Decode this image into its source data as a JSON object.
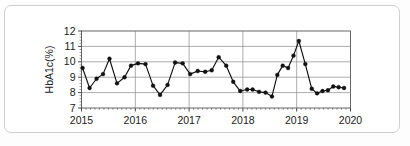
{
  "chart_data": {
    "type": "line",
    "title": "",
    "xlabel": "",
    "ylabel": "HbA1c(%)",
    "ylim": [
      7,
      12
    ],
    "xlim": [
      2015.0,
      2020.0
    ],
    "yticks": [
      7,
      8,
      9,
      10,
      11,
      12
    ],
    "ytick_labels": [
      "7",
      "8",
      "9",
      "10",
      "11",
      "12"
    ],
    "xticks": [
      2015,
      2016,
      2017,
      2018,
      2019,
      2020
    ],
    "xtick_labels": [
      "2015",
      "2016",
      "2017",
      "2018",
      "2019",
      "2020"
    ],
    "grid": true,
    "grid_axis": "y",
    "legend": false,
    "marker": "filled-circle",
    "line_color": "#111111",
    "marker_color": "#111111",
    "series": [
      {
        "name": "HbA1c",
        "x": [
          2015.02,
          2015.15,
          2015.28,
          2015.4,
          2015.52,
          2015.66,
          2015.8,
          2015.92,
          2016.05,
          2016.19,
          2016.33,
          2016.46,
          2016.6,
          2016.74,
          2016.88,
          2017.02,
          2017.16,
          2017.3,
          2017.42,
          2017.55,
          2017.69,
          2017.82,
          2017.95,
          2018.08,
          2018.18,
          2018.3,
          2018.42,
          2018.54,
          2018.64,
          2018.74,
          2018.84,
          2018.94,
          2019.04,
          2019.16,
          2019.28,
          2019.38,
          2019.48,
          2019.58,
          2019.68,
          2019.78,
          2019.88
        ],
        "values": [
          9.6,
          8.3,
          8.9,
          9.2,
          10.2,
          8.6,
          9.0,
          9.75,
          9.9,
          9.85,
          8.45,
          7.85,
          8.5,
          9.95,
          9.9,
          9.2,
          9.4,
          9.35,
          9.45,
          10.3,
          9.75,
          8.7,
          8.1,
          8.2,
          8.2,
          8.05,
          8.0,
          7.75,
          9.15,
          9.75,
          9.6,
          10.4,
          11.35,
          9.85,
          8.25,
          7.95,
          8.1,
          8.15,
          8.4,
          8.35,
          8.3
        ]
      }
    ]
  }
}
